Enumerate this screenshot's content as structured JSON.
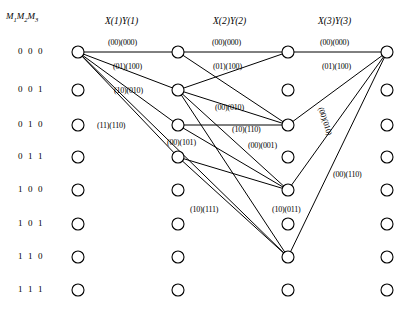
{
  "figure": {
    "type": "trellis-diagram",
    "state_header": {
      "prefix": "M",
      "sub1": "1",
      "mid": "M",
      "sub2": "2",
      "suffix": "M",
      "sub3": "3"
    },
    "state_header_text": "M1M2M3",
    "stage_headers": [
      {
        "label": "X(1)Y(1)",
        "x": 105,
        "y": 16
      },
      {
        "label": "X(2)Y(2)",
        "x": 213,
        "y": 16
      },
      {
        "label": "X(3)Y(3)",
        "x": 318,
        "y": 16
      }
    ],
    "row_labels": [
      "0 0 0",
      "0 0 1",
      "0 1 0",
      "0 1 1",
      "1 0 0",
      "1 0 1",
      "1 1 0",
      "1 1 1"
    ],
    "row_y": [
      52,
      90,
      125,
      157,
      190,
      224,
      257,
      290
    ],
    "column_x": [
      78,
      178,
      288,
      387
    ],
    "node_radius": 6,
    "nodes": [
      {
        "col": 0,
        "row": 0
      },
      {
        "col": 0,
        "row": 1
      },
      {
        "col": 0,
        "row": 2
      },
      {
        "col": 0,
        "row": 3
      },
      {
        "col": 0,
        "row": 4
      },
      {
        "col": 0,
        "row": 5
      },
      {
        "col": 0,
        "row": 6
      },
      {
        "col": 0,
        "row": 7
      },
      {
        "col": 1,
        "row": 0
      },
      {
        "col": 1,
        "row": 1
      },
      {
        "col": 1,
        "row": 2
      },
      {
        "col": 1,
        "row": 3
      },
      {
        "col": 1,
        "row": 4
      },
      {
        "col": 1,
        "row": 5
      },
      {
        "col": 1,
        "row": 6
      },
      {
        "col": 1,
        "row": 7
      },
      {
        "col": 2,
        "row": 0
      },
      {
        "col": 2,
        "row": 1
      },
      {
        "col": 2,
        "row": 2
      },
      {
        "col": 2,
        "row": 3
      },
      {
        "col": 2,
        "row": 4
      },
      {
        "col": 2,
        "row": 5
      },
      {
        "col": 2,
        "row": 6
      },
      {
        "col": 2,
        "row": 7
      },
      {
        "col": 3,
        "row": 0
      },
      {
        "col": 3,
        "row": 1
      },
      {
        "col": 3,
        "row": 2
      },
      {
        "col": 3,
        "row": 3
      },
      {
        "col": 3,
        "row": 4
      },
      {
        "col": 3,
        "row": 5
      },
      {
        "col": 3,
        "row": 6
      },
      {
        "col": 3,
        "row": 7
      }
    ],
    "edges": [
      {
        "from": {
          "col": 0,
          "row": 0
        },
        "to": {
          "col": 1,
          "row": 0
        }
      },
      {
        "from": {
          "col": 0,
          "row": 0
        },
        "to": {
          "col": 1,
          "row": 1
        }
      },
      {
        "from": {
          "col": 0,
          "row": 0
        },
        "to": {
          "col": 1,
          "row": 2
        }
      },
      {
        "from": {
          "col": 0,
          "row": 0
        },
        "to": {
          "col": 1,
          "row": 3
        }
      },
      {
        "from": {
          "col": 0,
          "row": 0
        },
        "to": {
          "col": 2,
          "row": 6
        }
      },
      {
        "from": {
          "col": 1,
          "row": 0
        },
        "to": {
          "col": 2,
          "row": 0
        }
      },
      {
        "from": {
          "col": 1,
          "row": 0
        },
        "to": {
          "col": 2,
          "row": 2
        }
      },
      {
        "from": {
          "col": 1,
          "row": 1
        },
        "to": {
          "col": 2,
          "row": 0
        }
      },
      {
        "from": {
          "col": 1,
          "row": 1
        },
        "to": {
          "col": 2,
          "row": 2
        }
      },
      {
        "from": {
          "col": 1,
          "row": 1
        },
        "to": {
          "col": 2,
          "row": 4
        }
      },
      {
        "from": {
          "col": 1,
          "row": 1
        },
        "to": {
          "col": 2,
          "row": 6
        }
      },
      {
        "from": {
          "col": 1,
          "row": 2
        },
        "to": {
          "col": 2,
          "row": 2
        }
      },
      {
        "from": {
          "col": 1,
          "row": 2
        },
        "to": {
          "col": 2,
          "row": 4
        }
      },
      {
        "from": {
          "col": 1,
          "row": 3
        },
        "to": {
          "col": 2,
          "row": 4
        }
      },
      {
        "from": {
          "col": 1,
          "row": 3
        },
        "to": {
          "col": 2,
          "row": 6
        }
      },
      {
        "from": {
          "col": 2,
          "row": 0
        },
        "to": {
          "col": 3,
          "row": 0
        }
      },
      {
        "from": {
          "col": 2,
          "row": 2
        },
        "to": {
          "col": 3,
          "row": 0
        }
      },
      {
        "from": {
          "col": 2,
          "row": 4
        },
        "to": {
          "col": 3,
          "row": 0
        }
      },
      {
        "from": {
          "col": 2,
          "row": 6
        },
        "to": {
          "col": 3,
          "row": 0
        }
      }
    ],
    "edge_labels": [
      {
        "text": "(00)(000)",
        "x": 108,
        "y": 38,
        "rotate": 0
      },
      {
        "text": "(01)(100)",
        "x": 113,
        "y": 62,
        "rotate": 0
      },
      {
        "text": "(10)(010)",
        "x": 114,
        "y": 86,
        "rotate": 0
      },
      {
        "text": "(11)(110)",
        "x": 97,
        "y": 121,
        "rotate": 0
      },
      {
        "text": "(00)(101)",
        "x": 167,
        "y": 138,
        "rotate": 0
      },
      {
        "text": "(00)(000)",
        "x": 212,
        "y": 38,
        "rotate": 0
      },
      {
        "text": "(01)(100)",
        "x": 213,
        "y": 62,
        "rotate": 0
      },
      {
        "text": "(00)(010)",
        "x": 215,
        "y": 103,
        "rotate": 0
      },
      {
        "text": "(10)(110)",
        "x": 232,
        "y": 125,
        "rotate": 0
      },
      {
        "text": "(00)(001)",
        "x": 248,
        "y": 141,
        "rotate": 0
      },
      {
        "text": "(10)(111)",
        "x": 190,
        "y": 205,
        "rotate": 0
      },
      {
        "text": "(10)(011)",
        "x": 272,
        "y": 205,
        "rotate": 0
      },
      {
        "text": "(00)(000)",
        "x": 320,
        "y": 38,
        "rotate": 0
      },
      {
        "text": "(01)(100)",
        "x": 322,
        "y": 62,
        "rotate": 0
      },
      {
        "text": "(00)(010)",
        "x": 325,
        "y": 106,
        "rotate": 72
      },
      {
        "text": "(00)(110)",
        "x": 333,
        "y": 170,
        "rotate": 0
      }
    ],
    "colors": {
      "line": "#000000",
      "node_fill": "#ffffff",
      "background": "#ffffff"
    }
  }
}
